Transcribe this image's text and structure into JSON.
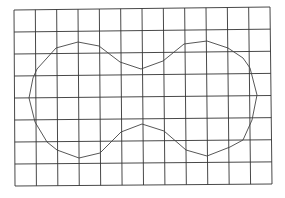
{
  "diagram": {
    "type": "grid-with-outline-shape",
    "grid": {
      "columns": 12,
      "rows": 8,
      "corners": {
        "top_left": [
          14,
          10
        ],
        "top_right": [
          270,
          7
        ],
        "bottom_right": [
          272,
          184
        ],
        "bottom_left": [
          15,
          186
        ]
      },
      "line_color": "#333333"
    },
    "shape": {
      "name": "peanut-outline",
      "stroke_color": "#444444",
      "points": [
        [
          29,
          98
        ],
        [
          33,
          78
        ],
        [
          37,
          69
        ],
        [
          47,
          58
        ],
        [
          56,
          48
        ],
        [
          78,
          42
        ],
        [
          99,
          46
        ],
        [
          120,
          62
        ],
        [
          141,
          69
        ],
        [
          163,
          61
        ],
        [
          184,
          44
        ],
        [
          207,
          41
        ],
        [
          228,
          48
        ],
        [
          243,
          58
        ],
        [
          250,
          68
        ],
        [
          257,
          95
        ],
        [
          252,
          120
        ],
        [
          243,
          140
        ],
        [
          230,
          147
        ],
        [
          207,
          156
        ],
        [
          186,
          150
        ],
        [
          164,
          131
        ],
        [
          142,
          124
        ],
        [
          121,
          132
        ],
        [
          100,
          153
        ],
        [
          79,
          158
        ],
        [
          57,
          150
        ],
        [
          47,
          142
        ],
        [
          35,
          122
        ]
      ]
    }
  }
}
